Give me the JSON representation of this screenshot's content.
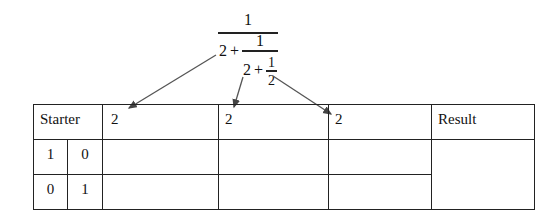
{
  "fraction": {
    "numerator_top": "1",
    "level1_whole": "2",
    "level1_plus": "+",
    "level1_numerator": "1",
    "level2_whole": "2",
    "level2_plus": "+",
    "level2_numerator": "1",
    "level2_denominator": "2"
  },
  "table": {
    "header": {
      "starter": "Starter",
      "col1": "2",
      "col2": "2",
      "col3": "2",
      "result": "Result"
    },
    "rows": [
      {
        "a": "1",
        "b": "0"
      },
      {
        "a": "0",
        "b": "1"
      }
    ]
  }
}
